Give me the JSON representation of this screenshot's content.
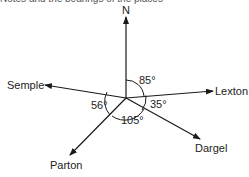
{
  "caption_fragment": "Notes and the bearings of the places",
  "compass": {
    "north_label": "N"
  },
  "places": [
    {
      "name": "Lexton"
    },
    {
      "name": "Semple"
    },
    {
      "name": "Parton"
    },
    {
      "name": "Dargel"
    }
  ],
  "angles": [
    {
      "label": "85°",
      "between": [
        "N",
        "Lexton"
      ]
    },
    {
      "label": "35°",
      "between": [
        "Lexton",
        "Dargel"
      ]
    },
    {
      "label": "105°",
      "between": [
        "Dargel",
        "Parton"
      ]
    },
    {
      "label": "56°",
      "between": [
        "Parton",
        "Semple"
      ]
    }
  ],
  "colors": {
    "line": "#1a1a1a",
    "text": "#222222"
  }
}
